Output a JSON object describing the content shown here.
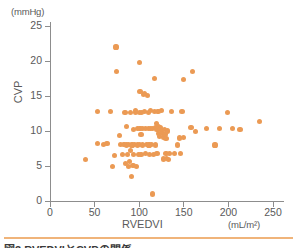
{
  "figure": {
    "caption": "図3 RVEDVIとCVPの関係",
    "rule_color": "#f0b47a"
  },
  "chart_data": {
    "type": "scatter",
    "title": "",
    "xlabel": "RVEDVI",
    "ylabel": "CVP",
    "x_unit": "(mL/m²)",
    "y_unit": "(mmHg)",
    "xlim": [
      0,
      260
    ],
    "ylim": [
      0,
      26
    ],
    "xticks": [
      0,
      50,
      100,
      150,
      200,
      250
    ],
    "yticks": [
      0,
      5,
      10,
      15,
      20,
      25
    ],
    "grid": false,
    "legend": null,
    "marker_color": "#eb9a54",
    "marker_size": 5,
    "series": [
      {
        "name": "patients",
        "points": [
          [
            40,
            5.9
          ],
          [
            53,
            12.8
          ],
          [
            53,
            8.2
          ],
          [
            60,
            8.1
          ],
          [
            64,
            8.2
          ],
          [
            68,
            12.8
          ],
          [
            70,
            4.9
          ],
          [
            72,
            6.5
          ],
          [
            74,
            22.0
          ],
          [
            75,
            18.5
          ],
          [
            78,
            9.3
          ],
          [
            79,
            8.1
          ],
          [
            81,
            6.6
          ],
          [
            83,
            8.1
          ],
          [
            84,
            12.6
          ],
          [
            85,
            5.4
          ],
          [
            86,
            8.0
          ],
          [
            86,
            10.6
          ],
          [
            87,
            6.6
          ],
          [
            88,
            4.9
          ],
          [
            88,
            8.1
          ],
          [
            89,
            5.6
          ],
          [
            90,
            12.7
          ],
          [
            90,
            7.2
          ],
          [
            91,
            3.5
          ],
          [
            92,
            8.0
          ],
          [
            93,
            5.1
          ],
          [
            94,
            10.2
          ],
          [
            94,
            6.7
          ],
          [
            95,
            8.1
          ],
          [
            96,
            12.7
          ],
          [
            96,
            12.9
          ],
          [
            97,
            4.9
          ],
          [
            98,
            8.0
          ],
          [
            98,
            10.3
          ],
          [
            99,
            6.7
          ],
          [
            100,
            19.8
          ],
          [
            100,
            12.6
          ],
          [
            100,
            8.1
          ],
          [
            101,
            15.6
          ],
          [
            101,
            10.3
          ],
          [
            102,
            9.5
          ],
          [
            102,
            6.7
          ],
          [
            103,
            12.7
          ],
          [
            104,
            8.0
          ],
          [
            104,
            10.4
          ],
          [
            105,
            15.2
          ],
          [
            106,
            15.3
          ],
          [
            106,
            12.8
          ],
          [
            107,
            10.3
          ],
          [
            107,
            6.8
          ],
          [
            108,
            8.1
          ],
          [
            109,
            15.1
          ],
          [
            110,
            12.7
          ],
          [
            110,
            10.4
          ],
          [
            111,
            8.0
          ],
          [
            112,
            6.7
          ],
          [
            113,
            12.9
          ],
          [
            113,
            10.4
          ],
          [
            114,
            8.1
          ],
          [
            115,
            1.0
          ],
          [
            115,
            10.3
          ],
          [
            116,
            6.6
          ],
          [
            117,
            17.5
          ],
          [
            117,
            12.8
          ],
          [
            118,
            10.5
          ],
          [
            118,
            8.0
          ],
          [
            119,
            11.1
          ],
          [
            120,
            10.2
          ],
          [
            120,
            6.8
          ],
          [
            121,
            12.8
          ],
          [
            122,
            10.6
          ],
          [
            122,
            9.7
          ],
          [
            123,
            9.2
          ],
          [
            124,
            10.5
          ],
          [
            125,
            10.1
          ],
          [
            125,
            12.9
          ],
          [
            126,
            9.6
          ],
          [
            127,
            9.1
          ],
          [
            127,
            6.0
          ],
          [
            128,
            10.2
          ],
          [
            129,
            9.5
          ],
          [
            130,
            6.8
          ],
          [
            130,
            8.9
          ],
          [
            131,
            6.1
          ],
          [
            132,
            10.0
          ],
          [
            133,
            5.9
          ],
          [
            134,
            6.8
          ],
          [
            136,
            12.8
          ],
          [
            140,
            6.8
          ],
          [
            143,
            8.0
          ],
          [
            145,
            9.0
          ],
          [
            146,
            6.8
          ],
          [
            148,
            12.8
          ],
          [
            150,
            17.3
          ],
          [
            150,
            9.1
          ],
          [
            158,
            10.5
          ],
          [
            160,
            18.5
          ],
          [
            163,
            9.9
          ],
          [
            175,
            10.3
          ],
          [
            185,
            8.0
          ],
          [
            190,
            10.4
          ],
          [
            199,
            12.7
          ],
          [
            205,
            10.3
          ],
          [
            213,
            10.2
          ],
          [
            235,
            11.3
          ]
        ]
      }
    ]
  }
}
